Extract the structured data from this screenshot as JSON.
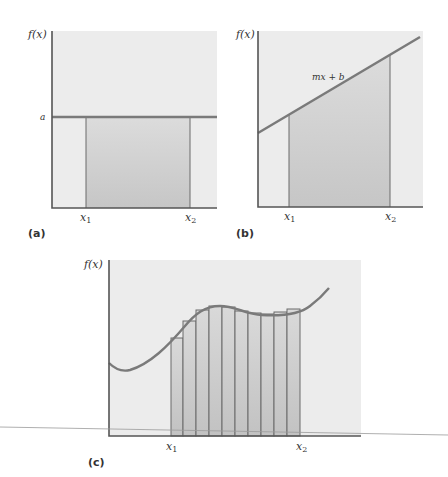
{
  "panels": {
    "a": {
      "label": "(a)",
      "y_label": "f(x)",
      "level_label": "a",
      "x1_label": "x",
      "x1_sub": "1",
      "x2_label": "x",
      "x2_sub": "2",
      "function": "constant"
    },
    "b": {
      "label": "(b)",
      "y_label": "f(x)",
      "line_label": "mx + b",
      "x1_label": "x",
      "x1_sub": "1",
      "x2_label": "x",
      "x2_sub": "2",
      "function": "linear"
    },
    "c": {
      "label": "(c)",
      "y_label": "f(x)",
      "x1_label": "x",
      "x1_sub": "1",
      "x2_label": "x",
      "x2_sub": "2",
      "function": "curve",
      "bar_count": 10
    }
  },
  "colors": {
    "panel_background": "#ececec",
    "shaded_region_top": "#dadada",
    "shaded_region_bottom": "#c4c4c4",
    "axis": "#555555",
    "curve": "#7a7a7a"
  }
}
